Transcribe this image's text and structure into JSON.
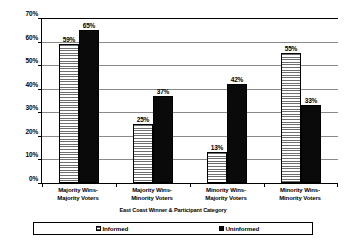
{
  "chart_data": {
    "type": "bar",
    "title": "",
    "xlabel": "East Coast Winner & Participant Category",
    "ylabel": "",
    "ylim": [
      0,
      70
    ],
    "ytick_step": 10,
    "grid": true,
    "legend_position": "bottom",
    "categories": [
      "Majority Wins-Majority Voters",
      "Majority Wins-Minority Voters",
      "Minority Wins-Majority Voters",
      "Minority Wins-Minority Voters"
    ],
    "category_lines": [
      [
        "Majority Wins-",
        "Majority Voters"
      ],
      [
        "Majority Wins-",
        "Minority Voters"
      ],
      [
        "Minority Wins-",
        "Majority Voters"
      ],
      [
        "Minority Wins-",
        "Minority Voters"
      ]
    ],
    "ytick_labels": [
      "70%",
      "60%",
      "50%",
      "40%",
      "30%",
      "20%",
      "10%",
      "0%"
    ],
    "ytick_values": [
      70,
      60,
      50,
      40,
      30,
      20,
      10,
      0
    ],
    "series": [
      {
        "name": "Informed",
        "values": [
          59,
          25,
          13,
          55
        ],
        "labels": [
          "59%",
          "25%",
          "13%",
          "55%"
        ],
        "fill": "horizontal-hatch-gray",
        "color": "#9a9a9a"
      },
      {
        "name": "Uninformed",
        "values": [
          65,
          37,
          42,
          33
        ],
        "labels": [
          "65%",
          "37%",
          "42%",
          "33%"
        ],
        "fill": "solid-black",
        "color": "#0a0a0a"
      }
    ]
  },
  "legend": {
    "entries": [
      {
        "label": "Informed"
      },
      {
        "label": "Uninformed"
      }
    ]
  }
}
